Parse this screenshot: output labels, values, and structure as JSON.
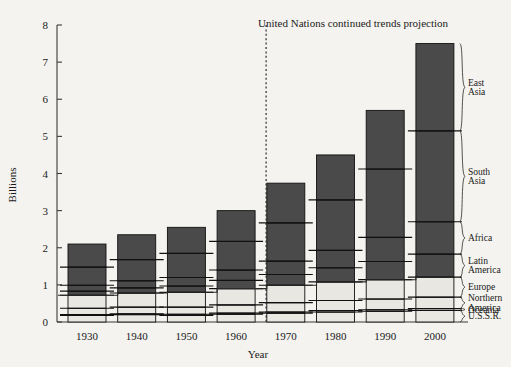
{
  "chart_data": {
    "type": "bar",
    "title": "United Nations continued trends projection",
    "xlabel": "Year",
    "ylabel": "Billions",
    "ylim": [
      0,
      8
    ],
    "yticks": [
      0,
      1,
      2,
      3,
      4,
      5,
      6,
      7,
      8
    ],
    "grid": false,
    "legend_position": "right-brackets",
    "stacked": true,
    "categories": [
      "1930",
      "1940",
      "1950",
      "1960",
      "1970",
      "1980",
      "1990",
      "2000"
    ],
    "series_order_bottom_to_top": [
      "U.S.S.R.",
      "Oceania",
      "Northern America",
      "Europe",
      "Latin America",
      "Africa",
      "South Asia",
      "East Asia"
    ],
    "series": [
      {
        "name": "U.S.S.R.",
        "shade": "light",
        "values": [
          0.18,
          0.2,
          0.18,
          0.21,
          0.24,
          0.27,
          0.29,
          0.31
        ]
      },
      {
        "name": "Oceania",
        "shade": "light",
        "values": [
          0.02,
          0.02,
          0.03,
          0.03,
          0.03,
          0.04,
          0.04,
          0.05
        ]
      },
      {
        "name": "Northern America",
        "shade": "light",
        "values": [
          0.17,
          0.18,
          0.19,
          0.22,
          0.25,
          0.27,
          0.29,
          0.31
        ]
      },
      {
        "name": "Europe",
        "shade": "light",
        "values": [
          0.35,
          0.38,
          0.4,
          0.44,
          0.47,
          0.5,
          0.52,
          0.54
        ]
      },
      {
        "name": "Latin America",
        "shade": "dark",
        "values": [
          0.11,
          0.14,
          0.17,
          0.22,
          0.29,
          0.38,
          0.49,
          0.62
        ]
      },
      {
        "name": "Africa",
        "shade": "dark",
        "values": [
          0.16,
          0.19,
          0.23,
          0.28,
          0.36,
          0.47,
          0.65,
          0.87
        ]
      },
      {
        "name": "South Asia",
        "shade": "dark",
        "values": [
          0.49,
          0.57,
          0.65,
          0.77,
          1.03,
          1.36,
          1.84,
          2.45
        ]
      },
      {
        "name": "East Asia",
        "shade": "dark",
        "values": [
          0.62,
          0.67,
          0.7,
          0.83,
          1.07,
          1.21,
          1.58,
          2.35
        ]
      }
    ],
    "totals": [
      2.1,
      2.35,
      2.55,
      3.0,
      3.74,
      4.5,
      5.7,
      7.5
    ],
    "projection_divider_after_category": "1960",
    "annotations": [
      {
        "text": "United Nations continued trends projection",
        "role": "projection-title"
      }
    ]
  },
  "axis": {
    "y_title": "Billions",
    "x_title": "Year",
    "y_ticks": [
      "8",
      "7",
      "6",
      "5",
      "4",
      "3",
      "2",
      "1",
      "0"
    ],
    "x_ticks": [
      "1930",
      "1940",
      "1950",
      "1960",
      "1970",
      "1980",
      "1990",
      "2000"
    ]
  },
  "region_labels": [
    {
      "id": "east-asia",
      "lines": [
        "East",
        "Asia"
      ]
    },
    {
      "id": "south-asia",
      "lines": [
        "South",
        "Asia"
      ]
    },
    {
      "id": "africa",
      "lines": [
        "Africa"
      ]
    },
    {
      "id": "latin-america",
      "lines": [
        "Latin",
        "America"
      ]
    },
    {
      "id": "europe",
      "lines": [
        "Europe"
      ]
    },
    {
      "id": "northern-america",
      "lines": [
        "Northern",
        "America"
      ]
    },
    {
      "id": "oceania",
      "lines": [
        "Oceania"
      ]
    },
    {
      "id": "ussr",
      "lines": [
        "U.S.S.R."
      ]
    }
  ],
  "colors": {
    "background": "#f4f3ef",
    "dark_segment": "#4a4a4a",
    "light_segment": "#e9e7e2",
    "ink": "#1a1a1a"
  }
}
